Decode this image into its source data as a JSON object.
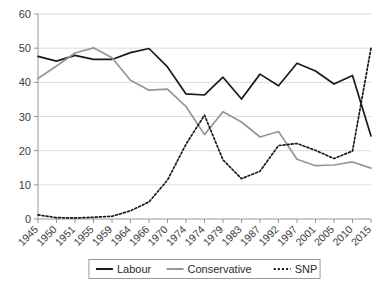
{
  "chart_data": {
    "type": "line",
    "title": "",
    "subtitle": "",
    "xlabel": "",
    "ylabel": "",
    "ylim": [
      0,
      60
    ],
    "yticks": [
      0,
      10,
      20,
      30,
      40,
      50,
      60
    ],
    "grid": true,
    "legend_position": "bottom",
    "categories": [
      "1945",
      "1950",
      "1951",
      "1955",
      "1959",
      "1964",
      "1966",
      "1970",
      "1974",
      "1974",
      "1979",
      "1983",
      "1987",
      "1992",
      "1997",
      "2001",
      "2005",
      "2010",
      "2015"
    ],
    "series": [
      {
        "name": "Labour",
        "color": "#1a1a1a",
        "style": "solid",
        "values": [
          47.6,
          46.2,
          47.9,
          46.7,
          46.7,
          48.7,
          49.9,
          44.5,
          36.6,
          36.3,
          41.5,
          35.1,
          42.4,
          39.0,
          45.6,
          43.3,
          39.5,
          42.0,
          24.3
        ]
      },
      {
        "name": "Conservative",
        "color": "#969696",
        "style": "solid",
        "values": [
          41.1,
          44.8,
          48.6,
          50.1,
          47.2,
          40.6,
          37.7,
          38.0,
          32.9,
          24.7,
          31.4,
          28.4,
          24.0,
          25.6,
          17.5,
          15.6,
          15.8,
          16.7,
          14.9
        ]
      },
      {
        "name": "SNP",
        "color": "#1a1a1a",
        "style": "dotted",
        "values": [
          1.2,
          0.4,
          0.3,
          0.5,
          0.8,
          2.4,
          5.0,
          11.4,
          21.9,
          30.4,
          17.3,
          11.8,
          14.0,
          21.5,
          22.1,
          20.1,
          17.7,
          19.9,
          50.0
        ]
      }
    ]
  },
  "legend": {
    "items": [
      {
        "label": "Labour"
      },
      {
        "label": "Conservative"
      },
      {
        "label": "SNP"
      }
    ]
  }
}
